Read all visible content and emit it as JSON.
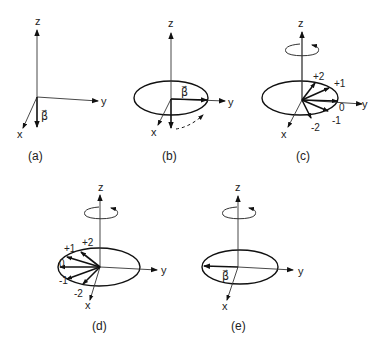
{
  "figure": {
    "panels": [
      {
        "id": "a",
        "caption": "(a)",
        "axis_labels": {
          "z": "z",
          "y": "y",
          "x": "x"
        },
        "vector_label": "β⃗",
        "has_ellipse": false,
        "has_rotation_arrow": false
      },
      {
        "id": "b",
        "caption": "(b)",
        "axis_labels": {
          "z": "z",
          "y": "y",
          "x": "x"
        },
        "vector_label": "β⃗",
        "has_ellipse": true,
        "has_rotation_arrow": false
      },
      {
        "id": "c",
        "caption": "(c)",
        "axis_labels": {
          "z": "z",
          "y": "y",
          "x": "x"
        },
        "state_labels": [
          "+2",
          "+1",
          "0",
          "-1",
          "-2"
        ],
        "has_ellipse": true,
        "has_rotation_arrow": true
      },
      {
        "id": "d",
        "caption": "(d)",
        "axis_labels": {
          "z": "z",
          "y": "y",
          "x": "x"
        },
        "state_labels": [
          "+2",
          "+1",
          "0",
          "-1",
          "-2"
        ],
        "has_ellipse": true,
        "has_rotation_arrow": true
      },
      {
        "id": "e",
        "caption": "(e)",
        "axis_labels": {
          "z": "z",
          "y": "y",
          "x": "x"
        },
        "vector_label": "β⃗",
        "has_ellipse": true,
        "has_rotation_arrow": true
      }
    ]
  }
}
